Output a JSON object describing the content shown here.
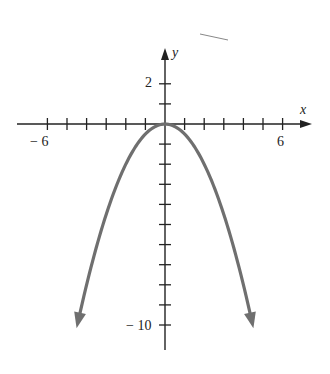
{
  "chart_data": {
    "type": "line",
    "title": "",
    "function": "y = -x^2 / 2",
    "xlabel": "x",
    "ylabel": "y",
    "x_ticks_labeled": [
      -6,
      6
    ],
    "y_ticks_labeled": [
      2,
      -10
    ],
    "xlim": [
      -7,
      7.2
    ],
    "ylim": [
      -11.3,
      3.3
    ],
    "x_tick_step": 1,
    "y_tick_step": 1,
    "grid": false,
    "series": [
      {
        "name": "parabola",
        "color": "#6f6f6f",
        "x": [
          -4.4,
          -4,
          -3,
          -2,
          -1,
          0,
          1,
          2,
          3,
          4,
          4.4
        ],
        "y": [
          -9.68,
          -8,
          -4.5,
          -2,
          -0.5,
          0,
          -0.5,
          -2,
          -4.5,
          -8,
          -9.68
        ],
        "arrows_at_ends": true
      }
    ]
  },
  "labels": {
    "x_axis": "x",
    "y_axis": "y",
    "x_neg": "− 6",
    "x_pos": "6",
    "y_pos": "2",
    "y_neg": "− 10"
  }
}
